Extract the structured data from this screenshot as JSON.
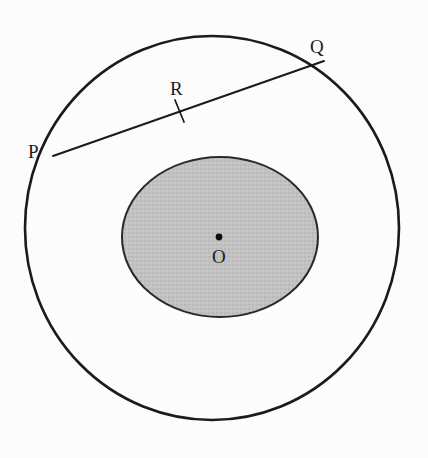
{
  "figure": {
    "caption": "",
    "background_color": "#fdfdfd",
    "stroke_color": "#1a1a1a",
    "inner_fill_color": "#c2c2c2",
    "center_dot_color": "#111111"
  },
  "labels": {
    "p": "P",
    "q": "Q",
    "r": "R",
    "o": "O"
  },
  "geometry": {
    "outer_circle": {
      "name": "outer-circle",
      "cx": 212,
      "cy": 228,
      "rx": 187,
      "ry": 192,
      "stroke_width": 2.6,
      "fill": "none"
    },
    "inner_circle": {
      "name": "inner-circle",
      "cx": 220,
      "cy": 237,
      "rx": 98,
      "ry": 80,
      "stroke_width": 2.0,
      "fill": "#c2c2c2"
    },
    "chord_pq": {
      "name": "chord-PQ",
      "x1": 53,
      "y1": 156,
      "x2": 324,
      "y2": 61,
      "stroke_width": 1.9
    },
    "tick_mark_r": {
      "name": "tangent-tick-R",
      "x1": 175,
      "y1": 100,
      "x2": 184,
      "y2": 122,
      "stroke_width": 1.7
    },
    "center_point_o": {
      "name": "center-point-O",
      "cx": 219,
      "cy": 237,
      "r": 3.4
    }
  }
}
